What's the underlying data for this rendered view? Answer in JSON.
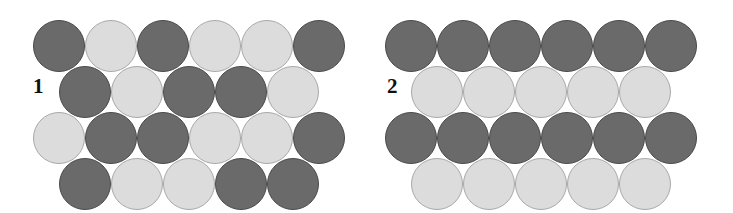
{
  "figure": {
    "title": "",
    "background_color": "#ffffff",
    "width": 733,
    "height": 213,
    "colors": {
      "dark_sphere": "#6a6a6a",
      "light_sphere": "#dcdcdc",
      "dark_sphere_outline": "#4a4a4a",
      "light_sphere_outline": "#a9a9a9",
      "label_text": "#111111"
    },
    "geometry": {
      "sphere_diameter": 52,
      "row_pitch_y": 46,
      "column_pitch_x": 52
    }
  },
  "panels": [
    {
      "label": "1",
      "label_x": 33,
      "label_y": 76,
      "origin_x": 33,
      "origin_y": 20,
      "description": "disordered-binary-close-packed-layer",
      "rows": [
        {
          "offset": 0,
          "y": 20,
          "spheres": [
            "dark",
            "light",
            "dark",
            "light",
            "light",
            "dark"
          ]
        },
        {
          "offset": 26,
          "y": 66,
          "spheres": [
            "dark",
            "light",
            "dark",
            "dark",
            "light"
          ]
        },
        {
          "offset": 0,
          "y": 112,
          "spheres": [
            "light",
            "dark",
            "dark",
            "light",
            "light",
            "dark"
          ]
        },
        {
          "offset": 26,
          "y": 158,
          "spheres": [
            "dark",
            "light",
            "light",
            "dark",
            "dark"
          ]
        }
      ]
    },
    {
      "label": "2",
      "label_x": 387,
      "label_y": 76,
      "origin_x": 385,
      "origin_y": 20,
      "description": "ordered-alternating-row-close-packed-layer",
      "rows": [
        {
          "offset": 0,
          "y": 20,
          "spheres": [
            "dark",
            "dark",
            "dark",
            "dark",
            "dark",
            "dark"
          ]
        },
        {
          "offset": 26,
          "y": 66,
          "spheres": [
            "light",
            "light",
            "light",
            "light",
            "light"
          ]
        },
        {
          "offset": 0,
          "y": 112,
          "spheres": [
            "dark",
            "dark",
            "dark",
            "dark",
            "dark",
            "dark"
          ]
        },
        {
          "offset": 26,
          "y": 158,
          "spheres": [
            "light",
            "light",
            "light",
            "light",
            "light"
          ]
        }
      ]
    }
  ]
}
